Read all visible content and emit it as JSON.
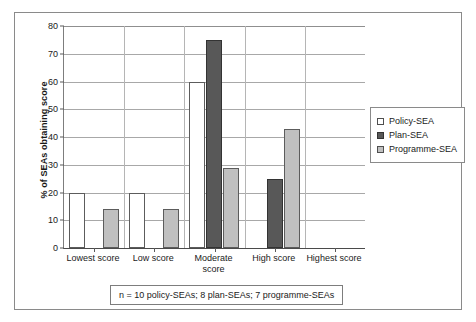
{
  "figure": {
    "footnote": "n = 10 policy-SEAs; 8 plan-SEAs; 7 programme-SEAs"
  },
  "legend": {
    "position": "right",
    "items": [
      {
        "label": "Policy-SEA",
        "swatch": "white-square-icon",
        "color": "#ffffff"
      },
      {
        "label": "Plan-SEA",
        "swatch": "dark-gray-square-icon",
        "color": "#585858"
      },
      {
        "label": "Programme-SEA",
        "swatch": "light-gray-square-icon",
        "color": "#c0c0c0"
      }
    ]
  },
  "chart_data": {
    "type": "bar",
    "title": "",
    "subtitle": "",
    "xlabel": "",
    "ylabel": "% of SEAs obtaining score",
    "ylim": [
      0,
      80
    ],
    "ytick_step": 10,
    "yticks": [
      0,
      10,
      20,
      30,
      40,
      50,
      60,
      70,
      80
    ],
    "grid": true,
    "grid_axis": "y",
    "legend_position": "right",
    "categories": [
      "Lowest score",
      "Low score",
      "Moderate\nscore",
      "High score",
      "Highest score"
    ],
    "series": [
      {
        "name": "Policy-SEA",
        "color": "#ffffff",
        "values": [
          20,
          20,
          60,
          0,
          0
        ]
      },
      {
        "name": "Plan-SEA",
        "color": "#585858",
        "values": [
          0,
          0,
          75,
          25,
          0
        ]
      },
      {
        "name": "Programme-SEA",
        "color": "#c0c0c0",
        "values": [
          14,
          14,
          29,
          43,
          0
        ]
      }
    ],
    "annotation": "n = 10 policy-SEAs; 8 plan-SEAs; 7 programme-SEAs"
  }
}
